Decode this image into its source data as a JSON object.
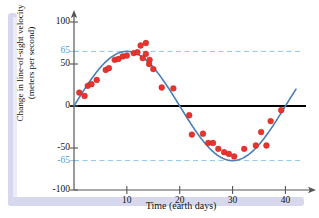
{
  "figure": {
    "background": "#ffffff",
    "frame_color": "#d7d8ed"
  },
  "chart_data": {
    "type": "scatter",
    "title": "",
    "xlabel": "Time (earth days)",
    "ylabel_line1": "Change in line-of-sight velocity",
    "ylabel_line2": "(meters per second)",
    "xlim": [
      0,
      42
    ],
    "ylim": [
      -100,
      100
    ],
    "xticks": [
      10,
      20,
      30,
      40
    ],
    "xticklabels": [
      "10",
      "20",
      "30",
      "40"
    ],
    "yticks": [
      -100,
      -65,
      -50,
      0,
      50,
      65,
      100
    ],
    "yticklabels": [
      "-100",
      "-65",
      "-50",
      "0",
      "50",
      "65",
      "100"
    ],
    "highlight_ticks": [
      65,
      -65
    ],
    "highlight_tick_labels": [
      "65",
      "-65"
    ],
    "highlight_color": "#4b9fd5",
    "grid": false,
    "legend": null,
    "axis_arrows": true,
    "zero_line_color": "#000000",
    "reference_lines": [
      {
        "y": 65,
        "style": "dashed",
        "color": "#8ec5e8",
        "label": "65"
      },
      {
        "y": -65,
        "style": "dashed",
        "color": "#8ec5e8",
        "label": "-65"
      }
    ],
    "series": [
      {
        "name": "fitted sine curve",
        "type": "line",
        "color": "#4a7fb5",
        "amplitude": 65,
        "period": 40,
        "phase": 0,
        "equation": "y = 65 sin(2*pi*t/40)",
        "x": [
          0,
          1,
          2,
          3,
          4,
          5,
          6,
          7,
          8,
          9,
          10,
          11,
          12,
          13,
          14,
          15,
          16,
          17,
          18,
          19,
          20,
          21,
          22,
          23,
          24,
          25,
          26,
          27,
          28,
          29,
          30,
          31,
          32,
          33,
          34,
          35,
          36,
          37,
          38,
          39,
          40,
          41
        ],
        "y": [
          0,
          10.2,
          20.1,
          29.4,
          38.2,
          46.0,
          52.6,
          57.9,
          61.8,
          64.2,
          65.0,
          64.2,
          61.8,
          57.9,
          52.6,
          46.0,
          38.2,
          29.4,
          20.1,
          10.2,
          0,
          -10.2,
          -20.1,
          -29.4,
          -38.2,
          -46.0,
          -52.6,
          -57.9,
          -61.8,
          -64.2,
          -65.0,
          -64.2,
          -61.8,
          -57.9,
          -52.6,
          -46.0,
          -38.2,
          -29.4,
          -20.1,
          -10.2,
          0,
          10.2
        ]
      },
      {
        "name": "observed velocity measurements",
        "type": "scatter",
        "color": "#e8342f",
        "marker": "circle",
        "points": [
          {
            "x": 1.0,
            "y": 16
          },
          {
            "x": 2.0,
            "y": 12
          },
          {
            "x": 2.6,
            "y": 24
          },
          {
            "x": 3.3,
            "y": 26
          },
          {
            "x": 4.3,
            "y": 31
          },
          {
            "x": 6.0,
            "y": 43
          },
          {
            "x": 6.6,
            "y": 45
          },
          {
            "x": 7.7,
            "y": 55
          },
          {
            "x": 8.4,
            "y": 56
          },
          {
            "x": 9.2,
            "y": 59
          },
          {
            "x": 10.0,
            "y": 60
          },
          {
            "x": 11.3,
            "y": 63
          },
          {
            "x": 12.0,
            "y": 64
          },
          {
            "x": 12.6,
            "y": 72
          },
          {
            "x": 13.0,
            "y": 57
          },
          {
            "x": 13.6,
            "y": 62
          },
          {
            "x": 13.6,
            "y": 75
          },
          {
            "x": 14.2,
            "y": 50
          },
          {
            "x": 14.3,
            "y": 55
          },
          {
            "x": 15.0,
            "y": 44
          },
          {
            "x": 16.6,
            "y": 22
          },
          {
            "x": 18.8,
            "y": 21
          },
          {
            "x": 21.8,
            "y": -11
          },
          {
            "x": 22.3,
            "y": -34
          },
          {
            "x": 24.4,
            "y": -33
          },
          {
            "x": 25.4,
            "y": -44
          },
          {
            "x": 26.3,
            "y": -44
          },
          {
            "x": 27.3,
            "y": -51
          },
          {
            "x": 28.4,
            "y": -55
          },
          {
            "x": 29.3,
            "y": -57
          },
          {
            "x": 30.3,
            "y": -60
          },
          {
            "x": 32.2,
            "y": -51
          },
          {
            "x": 34.4,
            "y": -47
          },
          {
            "x": 35.4,
            "y": -31
          },
          {
            "x": 36.4,
            "y": -47
          },
          {
            "x": 37.2,
            "y": -18
          },
          {
            "x": 39.2,
            "y": -5
          }
        ]
      }
    ]
  }
}
